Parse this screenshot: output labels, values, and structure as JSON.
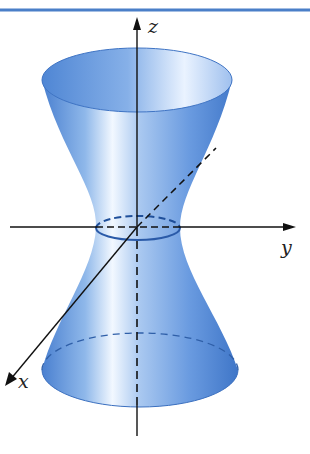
{
  "figure": {
    "surface_color": "#4f86d4",
    "surface_highlight": "#eef5ff",
    "border_color": "#4a7fc8",
    "axes": {
      "z": {
        "label": "z"
      },
      "y": {
        "label": "y"
      },
      "x": {
        "label": "x"
      }
    }
  }
}
